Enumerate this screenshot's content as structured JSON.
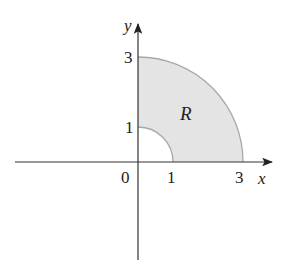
{
  "figure": {
    "colors": {
      "region_fill": "#e4e4e4",
      "arc_stroke": "#a8a8a8",
      "axis_stroke": "#333333",
      "text": "#222222"
    },
    "axes": {
      "x_label": "x",
      "y_label": "y",
      "origin_label": "0"
    },
    "ticks": {
      "x": [
        "1",
        "3"
      ],
      "y": [
        "1",
        "3"
      ]
    },
    "region": {
      "label": "R",
      "inner_radius": 1,
      "outer_radius": 3,
      "theta_range": "0 to π/2"
    }
  }
}
